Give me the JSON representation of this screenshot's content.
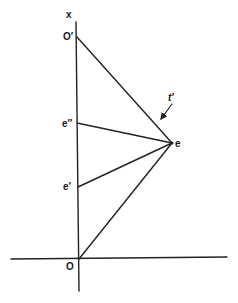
{
  "diagram": {
    "type": "spacetime-geometry",
    "stroke_color": "#222222",
    "background": "#ffffff",
    "labels": {
      "axis_x": "x",
      "origin_top": "O′",
      "event_upper": "e″",
      "event_lower": "e′",
      "event": "e",
      "origin": "O",
      "arrow": "t′"
    },
    "points": {
      "O_prime": [
        77,
        37
      ],
      "e_double_prime": [
        77,
        123
      ],
      "e_prime": [
        78,
        187
      ],
      "e": [
        172,
        143
      ],
      "O": [
        79,
        259
      ]
    },
    "lines": [
      {
        "name": "vertical-axis",
        "from": [
          76,
          22
        ],
        "to": [
          79,
          291
        ]
      },
      {
        "name": "horizontal-axis",
        "from": [
          11,
          259
        ],
        "to": [
          227,
          257
        ]
      },
      {
        "name": "line-O-prime-to-e",
        "from": [
          77,
          37
        ],
        "to": [
          172,
          143
        ]
      },
      {
        "name": "line-e-double-prime-to-e",
        "from": [
          77,
          123
        ],
        "to": [
          172,
          143
        ]
      },
      {
        "name": "line-e-prime-to-e",
        "from": [
          78,
          187
        ],
        "to": [
          172,
          143
        ]
      },
      {
        "name": "line-O-to-e",
        "from": [
          79,
          259
        ],
        "to": [
          172,
          143
        ]
      }
    ],
    "arrow": {
      "from": [
        172,
        104
      ],
      "to": [
        160,
        120
      ]
    }
  }
}
